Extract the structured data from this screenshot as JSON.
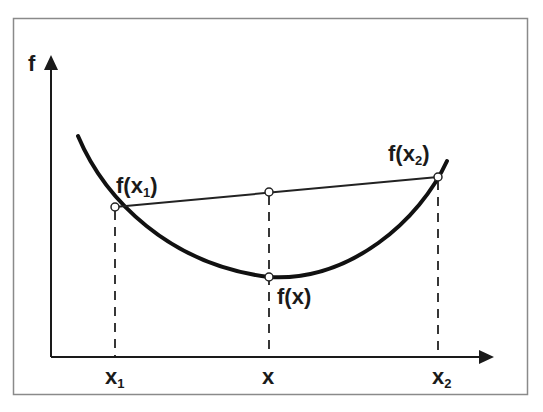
{
  "diagram": {
    "type": "convex-function-illustration",
    "colors": {
      "frame": "#8a8a8a",
      "axis": "#1a1a1a",
      "curve": "#111111",
      "chord": "#222222",
      "dashed": "#222222",
      "point_fill": "#ffffff",
      "text": "#1a1a1a"
    },
    "axes": {
      "y_label": "f",
      "x_ticks": [
        {
          "main": "x",
          "sub": "1"
        },
        {
          "main": "x",
          "sub": ""
        },
        {
          "main": "x",
          "sub": "2"
        }
      ]
    },
    "points": [
      {
        "label_main": "f(x",
        "label_sub": "1",
        "label_close": ")"
      },
      {
        "label_main": "f(x)",
        "label_sub": "",
        "label_close": ""
      },
      {
        "label_main": "f(x",
        "label_sub": "2",
        "label_close": ")"
      }
    ]
  }
}
